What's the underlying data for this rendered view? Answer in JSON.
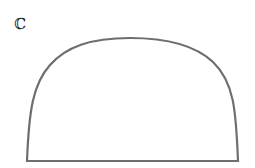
{
  "label": {
    "text": "ℂ"
  },
  "shape": {
    "type": "dome",
    "stroke": "#6e6e6e",
    "stroke_width": 2.2,
    "fill": "#ffffff",
    "path": "M27 161 L238 161 C236 110 234 82 213 62 C196 46 170 38 130 38 C90 38 66 47 50 65 C33 84 29 110 27 161 Z"
  }
}
